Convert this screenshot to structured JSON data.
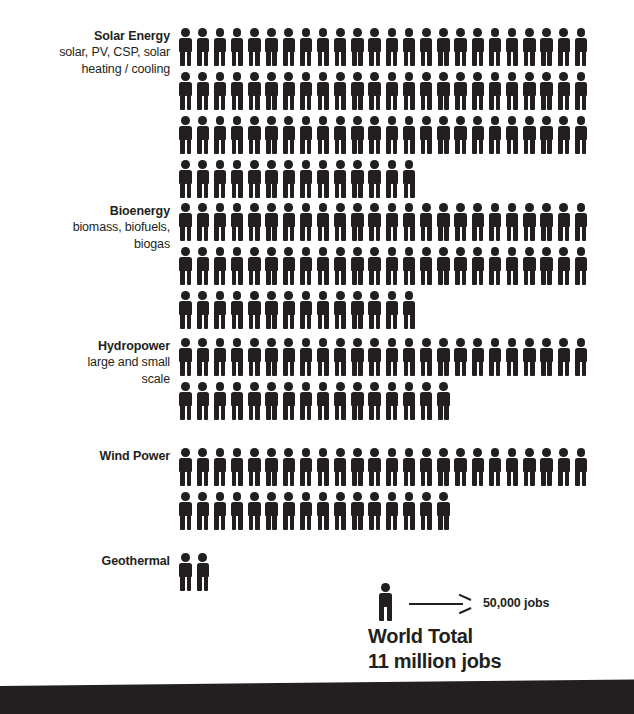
{
  "chart_data": {
    "type": "pictogram",
    "unit_label": "50,000 jobs",
    "unit_value": 50000,
    "icons_per_full_row": 24,
    "total_label": "World Total",
    "total_value_label": "11 million jobs",
    "total_icons": 230,
    "legend_position": "bottom-center",
    "categories": [
      "Solar Energy",
      "Bioenergy",
      "Hydropower",
      "Wind Power",
      "Geothermal"
    ],
    "values": [
      4300000,
      3100000,
      2000000,
      2000000,
      100000
    ],
    "icon_counts": [
      86,
      62,
      40,
      40,
      2
    ],
    "series": [
      {
        "name": "Jobs",
        "values": [
          4300000,
          3100000,
          2000000,
          2000000,
          100000
        ]
      }
    ]
  },
  "categories": [
    {
      "id": "solar-energy",
      "title": "Solar Energy",
      "subtitle": "solar, PV, CSP, solar\nheating / cooling",
      "icon_count": 86,
      "rows": [
        24,
        24,
        24,
        14
      ],
      "jobs": 4300000
    },
    {
      "id": "bioenergy",
      "title": "Bioenergy",
      "subtitle": "biomass, biofuels,\nbiogas",
      "icon_count": 62,
      "rows": [
        24,
        24,
        14
      ],
      "jobs": 3100000
    },
    {
      "id": "hydropower",
      "title": "Hydropower",
      "subtitle": "large and small\nscale",
      "icon_count": 40,
      "rows": [
        24,
        16
      ],
      "jobs": 2000000
    },
    {
      "id": "wind-power",
      "title": "Wind Power",
      "subtitle": "",
      "icon_count": 40,
      "rows": [
        24,
        16
      ],
      "jobs": 2000000
    },
    {
      "id": "geothermal",
      "title": "Geothermal",
      "subtitle": "",
      "icon_count": 2,
      "rows": [
        2
      ],
      "jobs": 100000
    }
  ],
  "legend": {
    "icon": "person-icon",
    "arrow": "arrow-right-icon",
    "text": "50,000 jobs"
  },
  "total": {
    "line1": "World Total",
    "line2": "11 million jobs"
  },
  "colors": {
    "ink": "#231f20",
    "background": "#ffffff",
    "band": "#231f20"
  }
}
